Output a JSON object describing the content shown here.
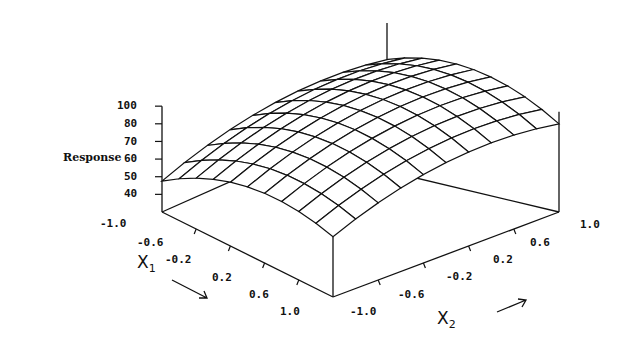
{
  "chart_data": {
    "type": "surface3d",
    "title": "",
    "zlabel": "Response",
    "xlabel": "X1",
    "ylabel": "X2",
    "x1_ticks": [
      "-1.0",
      "-0.6",
      "-0.2",
      "0.2",
      "0.6",
      "1.0"
    ],
    "x2_ticks": [
      "-1.0",
      "-0.6",
      "-0.2",
      "0.2",
      "0.6",
      "1.0"
    ],
    "z_ticks": [
      "100",
      "80",
      "70",
      "60",
      "50",
      "40"
    ],
    "x1_range": [
      -1.0,
      1.0
    ],
    "x2_range": [
      -1.0,
      1.0
    ],
    "z_range": [
      28,
      100
    ],
    "grid_lines": 11,
    "corner_values": {
      "x1=-1,x2=-1": 40,
      "x1=1,x2=-1": 77,
      "x1=1,x2=1": 91,
      "x1=-1,x2=1": 82,
      "max_near_center_back": 99
    },
    "model": "quadratic response surface (dome shaped), wireframe mesh"
  },
  "labels": {
    "response": "Response",
    "x1_name": "X",
    "x1_sub": "1",
    "x2_name": "X",
    "x2_sub": "2"
  }
}
